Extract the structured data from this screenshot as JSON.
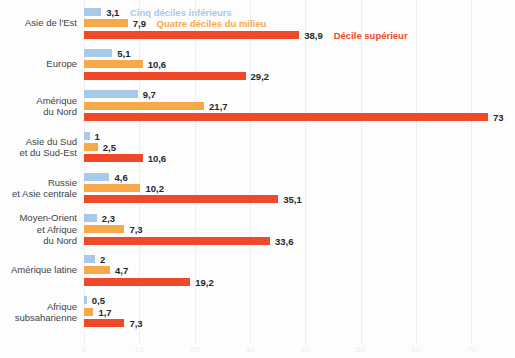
{
  "chart_data": {
    "type": "bar",
    "orientation": "horizontal",
    "title": "",
    "xlabel": "",
    "ylabel": "",
    "xlim": [
      0,
      73.5
    ],
    "grid": true,
    "gridlines_every": 10,
    "legend_position": "inline-first-group",
    "xticks": [
      "0",
      "10",
      "20",
      "30",
      "40",
      "50",
      "60",
      "70"
    ],
    "xtick_values": [
      0,
      10,
      20,
      30,
      40,
      50,
      60,
      70
    ],
    "categories": [
      "Asie de l'Est",
      "Europe",
      "Amérique\ndu Nord",
      "Asie du Sud\net du Sud-Est",
      "Russie\net Asie centrale",
      "Moyen-Orient\net Afrique\ndu Nord",
      "Amérique latine",
      "Afrique\nsubsaharienne"
    ],
    "series": [
      {
        "name": "Cinq déciles inférieurs",
        "key": "low",
        "color": "#a9c9e8",
        "values": [
          3.1,
          5.1,
          9.7,
          1,
          4.6,
          2.3,
          2,
          0.5
        ],
        "labels": [
          "3,1",
          "5,1",
          "9,7",
          "1",
          "4,6",
          "2,3",
          "2",
          "0,5"
        ]
      },
      {
        "name": "Quatre déciles du milieu",
        "key": "mid",
        "color": "#f7a949",
        "values": [
          7.9,
          10.6,
          21.7,
          2.5,
          10.2,
          7.3,
          4.7,
          1.7
        ],
        "labels": [
          "7,9",
          "10,6",
          "21,7",
          "2,5",
          "10,2",
          "7,3",
          "4,7",
          "1,7"
        ]
      },
      {
        "name": "Décile supérieur",
        "key": "top",
        "color": "#f1482a",
        "values": [
          38.9,
          29.2,
          73,
          10.6,
          35.1,
          33.6,
          19.2,
          7.3
        ],
        "labels": [
          "38,9",
          "29,2",
          "73",
          "10,6",
          "35,1",
          "33,6",
          "19,2",
          "7,3"
        ]
      }
    ]
  },
  "legend": {
    "low_label": "Cinq déciles inférieurs",
    "mid_label": "Quatre déciles du milieu",
    "top_label": "Décile supérieur"
  }
}
